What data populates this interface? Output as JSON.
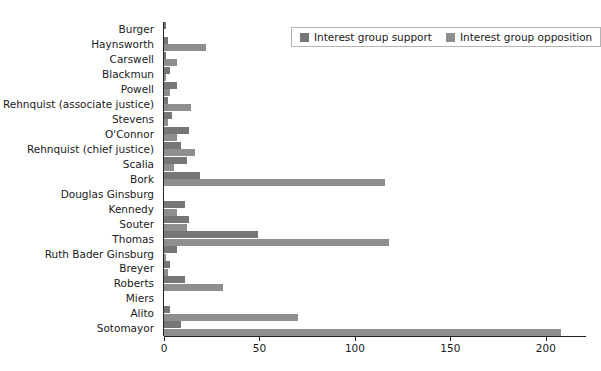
{
  "chart_data": {
    "type": "bar",
    "orientation": "horizontal",
    "title": "",
    "xlabel": "",
    "ylabel": "",
    "xlim": [
      0,
      220
    ],
    "xticks": [
      0,
      50,
      100,
      150,
      200
    ],
    "xticklabels": [
      "0",
      "50",
      "100",
      "150",
      "200"
    ],
    "grid": false,
    "legend_position": "top-right",
    "categories": [
      "Burger",
      "Haynsworth",
      "Carswell",
      "Blackmun",
      "Powell",
      "Rehnquist (associate justice)",
      "Stevens",
      "O'Connor",
      "Rehnquist (chief justice)",
      "Scalia",
      "Bork",
      "Douglas Ginsburg",
      "Kennedy",
      "Souter",
      "Thomas",
      "Ruth Bader Ginsburg",
      "Breyer",
      "Roberts",
      "Miers",
      "Alito",
      "Sotomayor"
    ],
    "series": [
      {
        "name": "Interest group support",
        "color": "#767676",
        "values": [
          1,
          2,
          1,
          3,
          7,
          2,
          4,
          13,
          9,
          12,
          19,
          0,
          11,
          13,
          49,
          7,
          3,
          11,
          0,
          3,
          9
        ]
      },
      {
        "name": "Interest group opposition",
        "color": "#8e8e8e",
        "values": [
          0,
          22,
          7,
          1,
          3,
          14,
          2,
          7,
          16,
          5,
          116,
          0,
          7,
          12,
          118,
          1,
          2,
          31,
          0,
          70,
          208
        ]
      }
    ]
  },
  "legend": {
    "items": [
      {
        "label": "Interest group support",
        "swatch": "support"
      },
      {
        "label": "Interest group opposition",
        "swatch": "opposition"
      }
    ]
  }
}
